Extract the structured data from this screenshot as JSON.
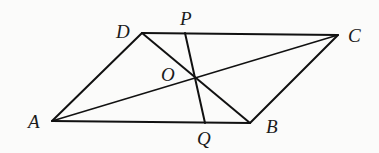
{
  "diagram": {
    "type": "parallelogram-geometry",
    "points": {
      "A": {
        "label": "A",
        "x": 52,
        "y": 121
      },
      "B": {
        "label": "B",
        "x": 250,
        "y": 123
      },
      "C": {
        "label": "C",
        "x": 338,
        "y": 35
      },
      "D": {
        "label": "D",
        "x": 142,
        "y": 33
      },
      "O": {
        "label": "O",
        "x": 195,
        "y": 78
      },
      "P": {
        "label": "P",
        "x": 185,
        "y": 33
      },
      "Q": {
        "label": "Q",
        "x": 205,
        "y": 123
      }
    },
    "segments": [
      "AB",
      "BC",
      "CD",
      "DA",
      "AC",
      "BD",
      "PQ"
    ],
    "colors": {
      "line": "#111111",
      "background": "#fbfbfa"
    }
  }
}
